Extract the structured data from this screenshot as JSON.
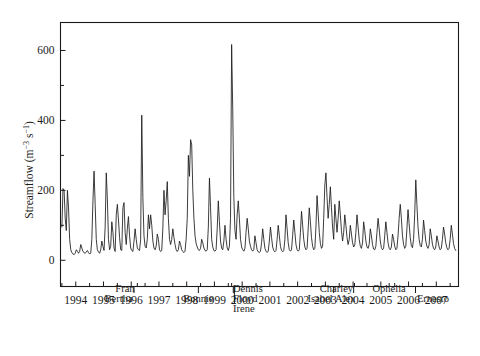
{
  "figure": {
    "background_color": "#ffffff",
    "line_color": "#1a1a1a"
  },
  "chart_data": {
    "type": "line",
    "title": "",
    "subtitle": "",
    "xlabel": "",
    "ylabel": "Streamflow (m-3 s-1)",
    "ylabel_parts": {
      "text_main": "Streamflow (m",
      "exp1": "−3",
      "mid": " s",
      "exp2": "−1",
      "tail": ")"
    },
    "grid": false,
    "legend": "none",
    "xlim": [
      1993.45,
      2007.8
    ],
    "ylim": [
      -75,
      680
    ],
    "y_ticks_major": [
      0,
      200,
      400,
      600
    ],
    "y_ticks_minor": [
      100,
      300,
      500
    ],
    "y_tick_labels": [
      "0",
      "200",
      "400",
      "600"
    ],
    "x_ticks": [
      1994,
      1995,
      1996,
      1997,
      1998,
      1999,
      2000,
      2001,
      2002,
      2003,
      2004,
      2005,
      2006,
      2007
    ],
    "x_tick_labels": [
      "1994",
      "1995",
      "1996",
      "1997",
      "1998",
      "1999",
      "2000",
      "2001",
      "2002",
      "2003",
      "2004",
      "2005",
      "2006",
      "2007"
    ],
    "x_minor_ticks": [
      1993.5,
      1994.5,
      1995.5,
      1996.5,
      1997.5,
      1998.5,
      1999.5,
      2000.5,
      2001.5,
      2002.5,
      2003.5,
      2004.5,
      2005.5,
      2006.5,
      2007.5
    ],
    "annotations": [
      {
        "label": "Bertha",
        "x": 1996.1,
        "text_x": 1996.05,
        "text_line": 1,
        "align": "end"
      },
      {
        "label": "Fran",
        "x": 1996.22,
        "text_x": 1996.12,
        "text_line": 0,
        "align": "end"
      },
      {
        "label": "Bonnie",
        "x": 1998.42,
        "text_x": 1998.42,
        "text_line": 1,
        "align": "middle"
      },
      {
        "label": "Dennis",
        "x": 1999.62,
        "text_x": 1999.67,
        "text_line": 0,
        "align": "start"
      },
      {
        "label": "Floyd",
        "x": 1999.68,
        "text_x": 1999.67,
        "text_line": 1,
        "align": "start"
      },
      {
        "label": "Irene",
        "x": 1999.72,
        "text_x": 1999.67,
        "text_line": 2,
        "align": "start"
      },
      {
        "label": "Isabel",
        "x": 2003.3,
        "text_x": 2003.26,
        "text_line": 1,
        "align": "end"
      },
      {
        "label": "Charley",
        "x": 2004.05,
        "text_x": 2004.0,
        "text_line": 0,
        "align": "end"
      },
      {
        "label": "Alex",
        "x": 2004.02,
        "text_x": 2003.35,
        "text_line": 1,
        "align": "start"
      },
      {
        "label": "Ophelia",
        "x": 2005.3,
        "text_x": 2005.3,
        "text_line": 0,
        "align": "middle"
      },
      {
        "label": "Ernesto",
        "x": 2006.25,
        "text_x": 2006.3,
        "text_line": 1,
        "align": "start"
      }
    ],
    "series": [
      {
        "name": "Streamflow",
        "x": [
          1993.5,
          1993.54,
          1993.58,
          1993.62,
          1993.66,
          1993.7,
          1993.74,
          1993.78,
          1993.82,
          1993.86,
          1993.9,
          1993.94,
          1993.98,
          1994.02,
          1994.06,
          1994.1,
          1994.14,
          1994.18,
          1994.22,
          1994.26,
          1994.3,
          1994.34,
          1994.38,
          1994.42,
          1994.46,
          1994.5,
          1994.54,
          1994.58,
          1994.62,
          1994.66,
          1994.7,
          1994.74,
          1994.78,
          1994.82,
          1994.86,
          1994.9,
          1994.94,
          1994.98,
          1995.02,
          1995.06,
          1995.1,
          1995.14,
          1995.18,
          1995.22,
          1995.26,
          1995.3,
          1995.34,
          1995.38,
          1995.42,
          1995.46,
          1995.5,
          1995.54,
          1995.58,
          1995.62,
          1995.66,
          1995.7,
          1995.74,
          1995.78,
          1995.82,
          1995.86,
          1995.9,
          1995.94,
          1995.98,
          1996.02,
          1996.06,
          1996.1,
          1996.14,
          1996.18,
          1996.22,
          1996.26,
          1996.3,
          1996.34,
          1996.38,
          1996.42,
          1996.46,
          1996.5,
          1996.54,
          1996.58,
          1996.62,
          1996.66,
          1996.7,
          1996.74,
          1996.78,
          1996.82,
          1996.86,
          1996.9,
          1996.94,
          1996.98,
          1997.02,
          1997.06,
          1997.1,
          1997.14,
          1997.18,
          1997.22,
          1997.26,
          1997.3,
          1997.34,
          1997.38,
          1997.42,
          1997.46,
          1997.5,
          1997.54,
          1997.58,
          1997.62,
          1997.66,
          1997.7,
          1997.74,
          1997.78,
          1997.82,
          1997.86,
          1997.9,
          1997.94,
          1997.98,
          1998.02,
          1998.06,
          1998.1,
          1998.14,
          1998.18,
          1998.22,
          1998.26,
          1998.3,
          1998.34,
          1998.38,
          1998.42,
          1998.46,
          1998.5,
          1998.54,
          1998.58,
          1998.62,
          1998.66,
          1998.7,
          1998.74,
          1998.78,
          1998.82,
          1998.86,
          1998.9,
          1998.94,
          1998.98,
          1999.02,
          1999.06,
          1999.1,
          1999.14,
          1999.18,
          1999.22,
          1999.26,
          1999.3,
          1999.34,
          1999.38,
          1999.42,
          1999.46,
          1999.5,
          1999.54,
          1999.58,
          1999.62,
          1999.66,
          1999.7,
          1999.74,
          1999.78,
          1999.82,
          1999.86,
          1999.9,
          1999.94,
          1999.98,
          2000.02,
          2000.06,
          2000.1,
          2000.14,
          2000.18,
          2000.22,
          2000.26,
          2000.3,
          2000.34,
          2000.38,
          2000.42,
          2000.46,
          2000.5,
          2000.54,
          2000.58,
          2000.62,
          2000.66,
          2000.7,
          2000.74,
          2000.78,
          2000.82,
          2000.86,
          2000.9,
          2000.94,
          2000.98,
          2001.02,
          2001.06,
          2001.1,
          2001.14,
          2001.18,
          2001.22,
          2001.26,
          2001.3,
          2001.34,
          2001.38,
          2001.42,
          2001.46,
          2001.5,
          2001.54,
          2001.58,
          2001.62,
          2001.66,
          2001.7,
          2001.74,
          2001.78,
          2001.82,
          2001.86,
          2001.9,
          2001.94,
          2001.98,
          2002.02,
          2002.06,
          2002.1,
          2002.14,
          2002.18,
          2002.22,
          2002.26,
          2002.3,
          2002.34,
          2002.38,
          2002.42,
          2002.46,
          2002.5,
          2002.54,
          2002.58,
          2002.62,
          2002.66,
          2002.7,
          2002.74,
          2002.78,
          2002.82,
          2002.86,
          2002.9,
          2002.94,
          2002.98,
          2003.02,
          2003.06,
          2003.1,
          2003.14,
          2003.18,
          2003.22,
          2003.26,
          2003.3,
          2003.34,
          2003.38,
          2003.42,
          2003.46,
          2003.5,
          2003.54,
          2003.58,
          2003.62,
          2003.66,
          2003.7,
          2003.74,
          2003.78,
          2003.82,
          2003.86,
          2003.9,
          2003.94,
          2003.98,
          2004.02,
          2004.06,
          2004.1,
          2004.14,
          2004.18,
          2004.22,
          2004.26,
          2004.3,
          2004.34,
          2004.38,
          2004.42,
          2004.46,
          2004.5,
          2004.54,
          2004.58,
          2004.62,
          2004.66,
          2004.7,
          2004.74,
          2004.78,
          2004.82,
          2004.86,
          2004.9,
          2004.94,
          2004.98,
          2005.02,
          2005.06,
          2005.1,
          2005.14,
          2005.18,
          2005.22,
          2005.26,
          2005.3,
          2005.34,
          2005.38,
          2005.42,
          2005.46,
          2005.5,
          2005.54,
          2005.58,
          2005.62,
          2005.66,
          2005.7,
          2005.74,
          2005.78,
          2005.82,
          2005.86,
          2005.9,
          2005.94,
          2005.98,
          2006.02,
          2006.06,
          2006.1,
          2006.14,
          2006.18,
          2006.22,
          2006.26,
          2006.3,
          2006.34,
          2006.38,
          2006.42,
          2006.46,
          2006.5,
          2006.54,
          2006.58,
          2006.62,
          2006.66,
          2006.7,
          2006.74,
          2006.78,
          2006.82,
          2006.86,
          2006.9,
          2006.94,
          2006.98,
          2007.02,
          2007.06,
          2007.1,
          2007.14,
          2007.18,
          2007.22,
          2007.26,
          2007.3,
          2007.34,
          2007.38,
          2007.42,
          2007.46,
          2007.5,
          2007.54,
          2007.58,
          2007.62,
          2007.66,
          2007.7
        ],
        "y": [
          95,
          205,
          200,
          120,
          85,
          200,
          150,
          60,
          30,
          22,
          18,
          16,
          20,
          30,
          26,
          20,
          25,
          45,
          35,
          25,
          22,
          20,
          24,
          28,
          22,
          18,
          20,
          60,
          170,
          255,
          160,
          60,
          30,
          24,
          20,
          30,
          55,
          40,
          28,
          95,
          250,
          175,
          60,
          30,
          40,
          110,
          80,
          35,
          25,
          130,
          160,
          115,
          65,
          30,
          28,
          150,
          165,
          80,
          45,
          90,
          125,
          70,
          35,
          28,
          25,
          55,
          90,
          60,
          35,
          30,
          28,
          60,
          415,
          180,
          70,
          40,
          35,
          60,
          130,
          90,
          130,
          100,
          55,
          35,
          30,
          40,
          75,
          60,
          30,
          25,
          28,
          90,
          200,
          130,
          170,
          225,
          120,
          60,
          45,
          60,
          90,
          65,
          45,
          30,
          25,
          30,
          55,
          45,
          30,
          25,
          22,
          26,
          60,
          120,
          300,
          240,
          345,
          330,
          200,
          120,
          70,
          48,
          38,
          30,
          28,
          34,
          60,
          50,
          35,
          28,
          26,
          30,
          95,
          235,
          150,
          60,
          38,
          28,
          26,
          30,
          90,
          170,
          110,
          55,
          35,
          30,
          55,
          100,
          60,
          35,
          28,
          40,
          120,
          617,
          430,
          180,
          85,
          60,
          130,
          170,
          120,
          60,
          38,
          30,
          26,
          34,
          80,
          120,
          90,
          55,
          40,
          30,
          26,
          30,
          70,
          50,
          30,
          24,
          22,
          26,
          50,
          90,
          60,
          34,
          26,
          22,
          26,
          55,
          95,
          65,
          38,
          28,
          24,
          28,
          60,
          100,
          70,
          40,
          28,
          24,
          28,
          60,
          130,
          90,
          50,
          30,
          26,
          30,
          70,
          115,
          80,
          45,
          30,
          26,
          30,
          80,
          140,
          100,
          60,
          38,
          30,
          34,
          90,
          150,
          110,
          65,
          40,
          30,
          34,
          95,
          185,
          135,
          80,
          48,
          34,
          40,
          120,
          215,
          250,
          180,
          120,
          160,
          210,
          150,
          95,
          60,
          160,
          120,
          80,
          120,
          170,
          130,
          85,
          55,
          80,
          130,
          100,
          65,
          45,
          60,
          100,
          75,
          50,
          38,
          44,
          80,
          130,
          95,
          60,
          40,
          34,
          50,
          110,
          85,
          55,
          38,
          34,
          46,
          90,
          70,
          45,
          32,
          30,
          40,
          80,
          120,
          90,
          55,
          36,
          30,
          34,
          70,
          110,
          80,
          50,
          34,
          30,
          38,
          75,
          60,
          40,
          30,
          34,
          70,
          120,
          160,
          120,
          70,
          45,
          34,
          40,
          90,
          145,
          105,
          65,
          42,
          36,
          60,
          130,
          230,
          160,
          95,
          60,
          42,
          38,
          60,
          115,
          85,
          55,
          40,
          34,
          44,
          90,
          70,
          46,
          34,
          30,
          38,
          70,
          55,
          38,
          30,
          34,
          60,
          95,
          75,
          50,
          36,
          30,
          34,
          60,
          100,
          75,
          48,
          34,
          28
        ]
      }
    ]
  }
}
